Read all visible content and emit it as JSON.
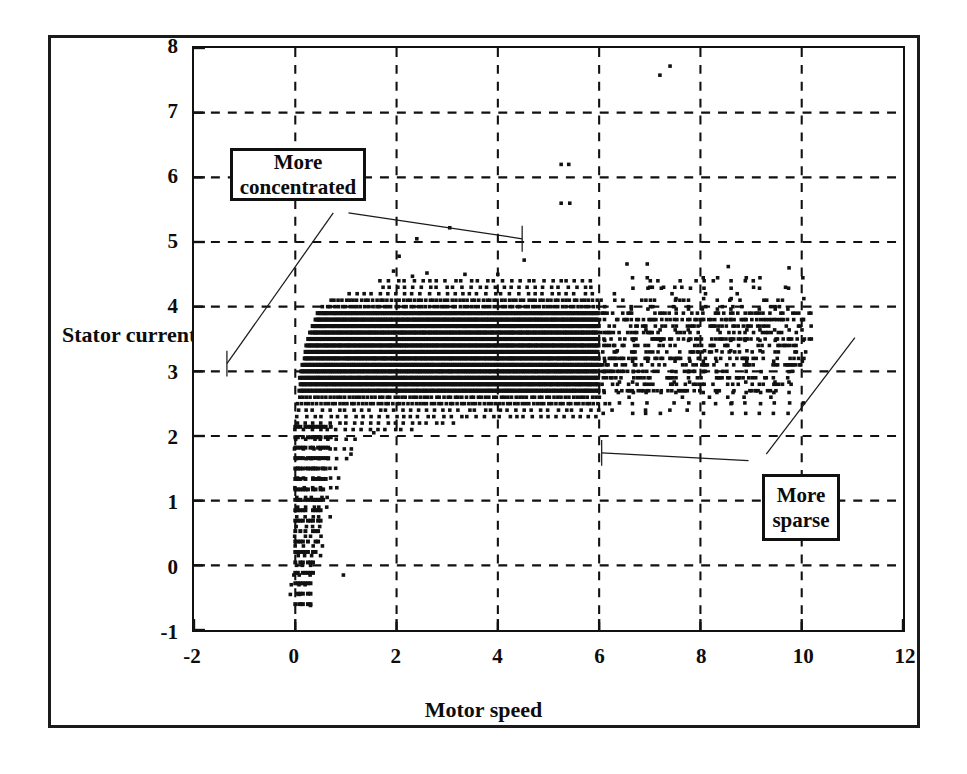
{
  "figure": {
    "background": "#ffffff",
    "ink_color": "#111111"
  },
  "axes": {
    "x_title": "Motor speed",
    "y_title_line1": "Stator",
    "y_title_line2": "current",
    "x_ticks": [
      "-2",
      "0",
      "2",
      "4",
      "6",
      "8",
      "10",
      "12"
    ],
    "y_ticks": [
      "8",
      "7",
      "6",
      "5",
      "4",
      "3",
      "2",
      "1",
      "0",
      "-1"
    ]
  },
  "annotations": [
    {
      "id": "more-concentrated",
      "line1": "More",
      "line2": "concentrated"
    },
    {
      "id": "more-sparse",
      "line1": "More",
      "line2": "sparse"
    }
  ],
  "chart_data": {
    "type": "scatter",
    "title": "",
    "xlabel": "Motor speed",
    "ylabel": "Stator current",
    "xlim": [
      -2,
      12
    ],
    "ylim": [
      -1,
      8
    ],
    "xticks": [
      -2,
      0,
      2,
      4,
      6,
      8,
      10,
      12
    ],
    "yticks": [
      -1,
      0,
      1,
      2,
      3,
      4,
      5,
      6,
      7,
      8
    ],
    "grid": true,
    "grid_style": "dashed",
    "legend": null,
    "marker": "square",
    "marker_color": "#111111",
    "marker_size_px": 4,
    "annotations": [
      {
        "text": "More concentrated",
        "box_xy": [
          0.75,
          5.85
        ],
        "leaders": [
          {
            "from": [
              0.75,
              5.45
            ],
            "to": [
              -1.35,
              3.12
            ]
          },
          {
            "from": [
              1.05,
              5.45
            ],
            "to": [
              4.48,
              5.05
            ]
          }
        ]
      },
      {
        "text": "More sparse",
        "box_xy": [
          9.2,
          1.3
        ],
        "leaders": [
          {
            "from": [
              9.3,
              1.72
            ],
            "to": [
              11.05,
              3.52
            ]
          },
          {
            "from": [
              8.95,
              1.62
            ],
            "to": [
              6.05,
              1.74
            ]
          }
        ]
      }
    ],
    "quantisation": {
      "current_step": 0.1613,
      "note": "Stator current samples fall on a discrete ladder of levels; each level renders as a horizontal band of markers."
    },
    "bands": [
      {
        "current": 4.55,
        "x_start": 1.95,
        "x_end": 2.05,
        "density": 0.1
      },
      {
        "current": 4.47,
        "x_start": 2.35,
        "x_end": 2.45,
        "density": 0.1
      },
      {
        "current": 4.4,
        "x_start": 1.7,
        "x_end": 9.1,
        "density": 0.1
      },
      {
        "current": 4.3,
        "x_start": 1.7,
        "x_end": 9.9,
        "density": 0.14
      },
      {
        "current": 4.2,
        "x_start": 1.05,
        "x_end": 10.0,
        "density": 0.22
      },
      {
        "current": 4.1,
        "x_start": 0.7,
        "x_end": 10.1,
        "density": 0.34
      },
      {
        "current": 4.0,
        "x_start": 0.55,
        "x_end": 10.2,
        "density": 0.52
      },
      {
        "current": 3.9,
        "x_start": 0.45,
        "x_end": 10.2,
        "density": 0.66
      },
      {
        "current": 3.8,
        "x_start": 0.4,
        "x_end": 10.2,
        "density": 0.74
      },
      {
        "current": 3.7,
        "x_start": 0.35,
        "x_end": 10.2,
        "density": 0.8
      },
      {
        "current": 3.6,
        "x_start": 0.3,
        "x_end": 10.2,
        "density": 0.84
      },
      {
        "current": 3.5,
        "x_start": 0.25,
        "x_end": 10.2,
        "density": 0.86
      },
      {
        "current": 3.4,
        "x_start": 0.22,
        "x_end": 10.2,
        "density": 0.88
      },
      {
        "current": 3.3,
        "x_start": 0.2,
        "x_end": 10.15,
        "density": 0.88
      },
      {
        "current": 3.2,
        "x_start": 0.18,
        "x_end": 10.1,
        "density": 0.86
      },
      {
        "current": 3.1,
        "x_start": 0.15,
        "x_end": 10.0,
        "density": 0.84
      },
      {
        "current": 3.0,
        "x_start": 0.12,
        "x_end": 9.95,
        "density": 0.82
      },
      {
        "current": 2.9,
        "x_start": 0.1,
        "x_end": 9.9,
        "density": 0.76
      },
      {
        "current": 2.8,
        "x_start": 0.1,
        "x_end": 9.8,
        "density": 0.7
      },
      {
        "current": 2.7,
        "x_start": 0.08,
        "x_end": 9.6,
        "density": 0.58
      },
      {
        "current": 2.6,
        "x_start": 0.08,
        "x_end": 9.4,
        "density": 0.46
      },
      {
        "current": 2.5,
        "x_start": 0.05,
        "x_end": 9.2,
        "density": 0.36
      },
      {
        "current": 2.4,
        "x_start": 0.05,
        "x_end": 8.4,
        "density": 0.26
      },
      {
        "current": 2.3,
        "x_start": 0.05,
        "x_end": 6.3,
        "density": 0.2
      },
      {
        "current": 2.2,
        "x_start": 0.05,
        "x_end": 3.1,
        "density": 0.16
      },
      {
        "current": 2.1,
        "x_start": 0.03,
        "x_end": 2.4,
        "density": 0.14
      },
      {
        "current": 1.95,
        "x_start": 0.03,
        "x_end": 1.3,
        "density": 0.12
      },
      {
        "current": 1.8,
        "x_start": 0.02,
        "x_end": 1.15,
        "density": 0.12
      },
      {
        "current": 1.65,
        "x_start": 0.02,
        "x_end": 1.05,
        "density": 0.12
      },
      {
        "current": 1.5,
        "x_start": 0.02,
        "x_end": 0.95,
        "density": 0.12
      },
      {
        "current": 1.35,
        "x_start": 0.02,
        "x_end": 0.9,
        "density": 0.12
      },
      {
        "current": 1.2,
        "x_start": 0.02,
        "x_end": 0.85,
        "density": 0.12
      },
      {
        "current": 1.05,
        "x_start": 0.02,
        "x_end": 0.8,
        "density": 0.12
      },
      {
        "current": 0.9,
        "x_start": 0.02,
        "x_end": 0.75,
        "density": 0.12
      },
      {
        "current": 0.75,
        "x_start": 0.02,
        "x_end": 0.7,
        "density": 0.12
      },
      {
        "current": 0.6,
        "x_start": 0.02,
        "x_end": 0.65,
        "density": 0.12
      },
      {
        "current": 0.45,
        "x_start": 0.02,
        "x_end": 0.6,
        "density": 0.12
      },
      {
        "current": 0.3,
        "x_start": 0.02,
        "x_end": 0.55,
        "density": 0.12
      },
      {
        "current": 0.15,
        "x_start": 0.02,
        "x_end": 0.5,
        "density": 0.12
      },
      {
        "current": 0.0,
        "x_start": 0.0,
        "x_end": 0.45,
        "density": 0.12
      },
      {
        "current": -0.15,
        "x_start": -0.05,
        "x_end": 0.3,
        "density": 0.1
      },
      {
        "current": -0.3,
        "x_start": -0.1,
        "x_end": 0.25,
        "density": 0.08
      },
      {
        "current": -0.45,
        "x_start": -0.1,
        "x_end": 0.2,
        "density": 0.06
      },
      {
        "current": -0.6,
        "x_start": 0.05,
        "x_end": 0.15,
        "density": 0.05
      }
    ],
    "sparse_lattice": {
      "x_start": 6.1,
      "x_end": 10.2,
      "x_step": 0.28,
      "y_start": 2.35,
      "y_end": 4.45,
      "y_step": 0.1613,
      "note": "Above speed 6 the samples sit on a visible rectangular lattice with large gaps between markers."
    },
    "outliers": [
      {
        "x": 7.2,
        "y": 7.58
      },
      {
        "x": 7.4,
        "y": 7.72
      },
      {
        "x": 5.25,
        "y": 6.2
      },
      {
        "x": 5.4,
        "y": 6.2
      },
      {
        "x": 5.25,
        "y": 5.6
      },
      {
        "x": 5.42,
        "y": 5.6
      },
      {
        "x": 3.05,
        "y": 5.22
      },
      {
        "x": 2.4,
        "y": 5.05
      },
      {
        "x": 2.05,
        "y": 4.78
      },
      {
        "x": 4.52,
        "y": 4.72
      },
      {
        "x": 6.55,
        "y": 4.66
      },
      {
        "x": 6.95,
        "y": 4.66
      },
      {
        "x": 8.55,
        "y": 4.62
      },
      {
        "x": 9.75,
        "y": 4.6
      },
      {
        "x": 7.05,
        "y": 4.3
      },
      {
        "x": 8.1,
        "y": 4.2
      },
      {
        "x": 2.6,
        "y": 4.52
      },
      {
        "x": 3.35,
        "y": 4.5
      },
      {
        "x": 4.0,
        "y": 4.5
      },
      {
        "x": 1.55,
        "y": 2.05
      },
      {
        "x": 1.1,
        "y": 1.72
      },
      {
        "x": 0.95,
        "y": -0.15
      },
      {
        "x": 0.3,
        "y": -0.62
      }
    ]
  }
}
